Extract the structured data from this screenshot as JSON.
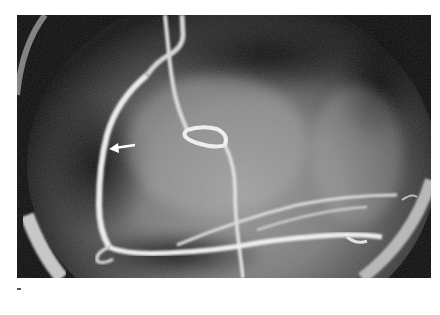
{
  "figure": {
    "type": "coronary-angiogram",
    "annotation": {
      "kind": "arrow",
      "direction": "left",
      "color": "#ffffff"
    },
    "colors": {
      "background": "#0c0c0c",
      "vessel": "#f2f2f2",
      "ring": "#bdbdbd"
    }
  }
}
